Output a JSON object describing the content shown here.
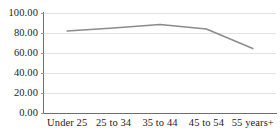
{
  "chart_data": {
    "type": "line",
    "title": "",
    "subtitle": "",
    "xlabel": "",
    "ylabel": "",
    "categories": [
      "Under 25",
      "25 to 34",
      "35 to 44",
      "45 to 54",
      "55 years+"
    ],
    "series": [
      {
        "name": "",
        "values": [
          82.0,
          85.0,
          88.5,
          84.0,
          64.5
        ],
        "color": "#8c8c8c"
      }
    ],
    "ylim": [
      0,
      100
    ],
    "ytick_step": 20,
    "ytick_labels": [
      "0.00",
      "20.00",
      "40.00",
      "60.00",
      "80.00",
      "100.00"
    ],
    "ytick_values": [
      0,
      20,
      40,
      60,
      80,
      100
    ],
    "grid": {
      "horizontal": true,
      "vertical": false,
      "color": "#e3e3e3"
    },
    "legend": {
      "visible": false,
      "position": "none"
    },
    "axis_color": "#6e6e6e",
    "plot_background": "#ffffff",
    "markers": false,
    "line_width": 1.6
  }
}
